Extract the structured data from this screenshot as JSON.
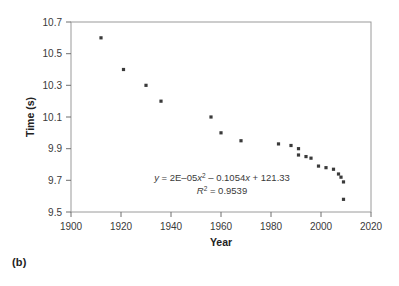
{
  "figure": {
    "panel_label": "(b)"
  },
  "chart_data": {
    "type": "scatter",
    "title": "",
    "xlabel": "Year",
    "ylabel": "Time (s)",
    "xlim": [
      1900,
      2020
    ],
    "ylim": [
      9.5,
      10.7
    ],
    "xticks": [
      1900,
      1920,
      1940,
      1960,
      1980,
      2000,
      2020
    ],
    "xtick_labels": [
      "1900",
      "1920",
      "1940",
      "1960",
      "1980",
      "2000",
      "2020"
    ],
    "yticks": [
      9.5,
      9.7,
      9.9,
      10.1,
      10.3,
      10.5,
      10.7
    ],
    "ytick_labels": [
      "9.5",
      "9.7",
      "9.9",
      "10.1",
      "10.3",
      "10.5",
      "10.7"
    ],
    "grid": false,
    "legend": "none",
    "marker": "square",
    "marker_color": "#3a3a3a",
    "line_color": "#3b3b3b",
    "x": [
      1912,
      1921,
      1930,
      1936,
      1956,
      1960,
      1968,
      1983,
      1988,
      1991,
      1991,
      1994,
      1996,
      1999,
      2002,
      2005,
      2007,
      2008,
      2009,
      2009
    ],
    "y": [
      10.6,
      10.4,
      10.3,
      10.2,
      10.1,
      10.0,
      9.95,
      9.93,
      9.92,
      9.9,
      9.86,
      9.85,
      9.84,
      9.79,
      9.78,
      9.77,
      9.74,
      9.72,
      9.69,
      9.58
    ],
    "series": [
      {
        "name": "100 m world record",
        "points": [
          [
            1912,
            10.6
          ],
          [
            1921,
            10.4
          ],
          [
            1930,
            10.3
          ],
          [
            1936,
            10.2
          ],
          [
            1956,
            10.1
          ],
          [
            1960,
            10.0
          ],
          [
            1968,
            9.95
          ],
          [
            1983,
            9.93
          ],
          [
            1988,
            9.92
          ],
          [
            1991,
            9.9
          ],
          [
            1991,
            9.86
          ],
          [
            1994,
            9.85
          ],
          [
            1996,
            9.84
          ],
          [
            1999,
            9.79
          ],
          [
            2002,
            9.78
          ],
          [
            2005,
            9.77
          ],
          [
            2007,
            9.74
          ],
          [
            2008,
            9.72
          ],
          [
            2009,
            9.69
          ],
          [
            2009,
            9.58
          ]
        ]
      }
    ],
    "trendline": {
      "type": "polynomial",
      "degree": 2,
      "a": 2e-05,
      "b": -0.1054,
      "c": 121.33,
      "x_start": 1912,
      "x_end": 2010
    },
    "annotations": {
      "equation_prefix": "y",
      "equation_eq1": " = 2E–05",
      "equation_var1": "x",
      "equation_sup1": "2",
      "equation_mid": " – 0.1054",
      "equation_var2": "x",
      "equation_tail": " + 121.33",
      "r2_symbol": "R",
      "r2_sup": "2",
      "r2_value": " = 0.9539",
      "equation_full": "y = 2E–05x² – 0.1054x + 121.33",
      "r2_full": "R² = 0.9539"
    }
  }
}
